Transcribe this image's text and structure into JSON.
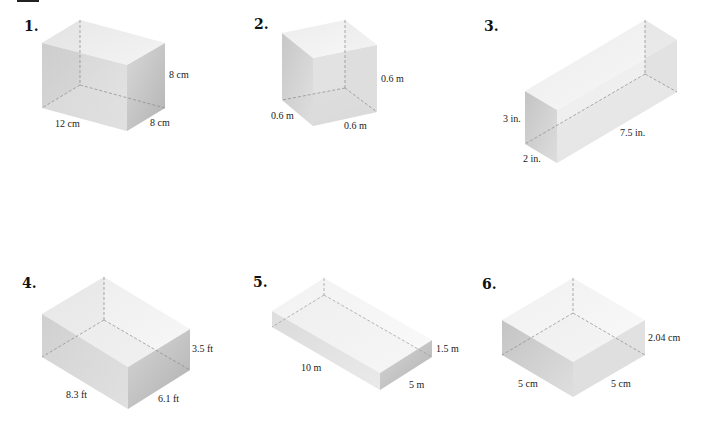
{
  "problems": [
    {
      "number": "1.",
      "labels": {
        "height": "8 cm",
        "length": "12 cm",
        "width": "8 cm"
      }
    },
    {
      "number": "2.",
      "labels": {
        "height": "0.6 m",
        "left": "0.6 m",
        "bottom": "0.6 m"
      }
    },
    {
      "number": "3.",
      "labels": {
        "height": "3 in.",
        "width": "2 in.",
        "length": "7.5 in."
      }
    },
    {
      "number": "4.",
      "labels": {
        "height": "3.5 ft",
        "length": "8.3 ft",
        "width": "6.1 ft"
      }
    },
    {
      "number": "5.",
      "labels": {
        "height": "1.5 m",
        "length": "10 m",
        "width": "5 m"
      }
    },
    {
      "number": "6.",
      "labels": {
        "height": "2.04 cm",
        "left": "5 cm",
        "right": "5 cm"
      }
    }
  ]
}
